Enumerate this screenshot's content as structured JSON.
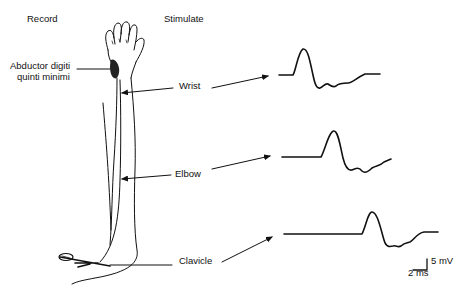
{
  "headers": {
    "record": "Record",
    "stimulate": "Stimulate"
  },
  "labels": {
    "muscle_line1": "Abductor digiti",
    "muscle_line2": "quinti minimi",
    "wrist": "Wrist",
    "elbow": "Elbow",
    "clavicle": "Clavicle"
  },
  "scale_bar": {
    "amplitude": "5 mV",
    "time": "2 ms"
  },
  "traces": [
    {
      "site": "Wrist",
      "order": 1
    },
    {
      "site": "Elbow",
      "order": 2
    },
    {
      "site": "Clavicle",
      "order": 3
    }
  ],
  "colors": {
    "ink": "#111111",
    "background": "#ffffff"
  }
}
